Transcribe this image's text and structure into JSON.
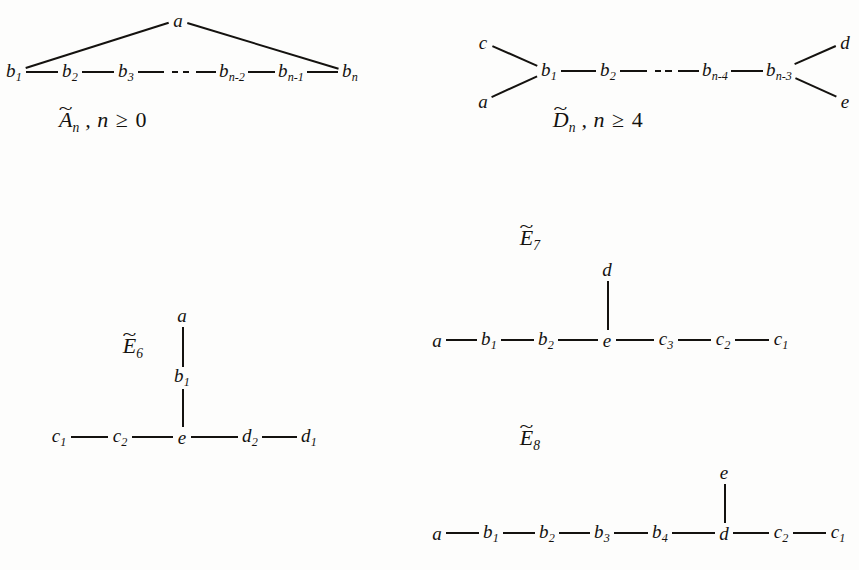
{
  "figure": {
    "ink_color": "#14120f",
    "background_color": "#fdfdfc"
  },
  "diagrams": [
    {
      "id": "A-tilde",
      "name": "A_n_affine",
      "label_base": "A",
      "label_sub": "n",
      "tilde": "~",
      "condition_var": "n",
      "condition_rel": "≥",
      "condition_value": "0",
      "label_text": "Ãₙ , n ≥ 0",
      "label_x": 103,
      "label_y": 122,
      "nodes": [
        {
          "name": "a",
          "base": "a",
          "sub": "",
          "x": 178,
          "y": 20
        },
        {
          "name": "b1",
          "base": "b",
          "sub": "1",
          "x": 14,
          "y": 72
        },
        {
          "name": "b2",
          "base": "b",
          "sub": "2",
          "x": 70,
          "y": 72
        },
        {
          "name": "b3",
          "base": "b",
          "sub": "3",
          "x": 126,
          "y": 72
        },
        {
          "name": "bn-2",
          "base": "b",
          "sub": "n-2",
          "x": 232,
          "y": 72
        },
        {
          "name": "bn-1",
          "base": "b",
          "sub": "n-1",
          "x": 291,
          "y": 72
        },
        {
          "name": "bn",
          "base": "b",
          "sub": "n",
          "x": 350,
          "y": 72
        }
      ],
      "edges": [
        {
          "from": "b1",
          "to": "a"
        },
        {
          "from": "a",
          "to": "bn"
        },
        {
          "from": "b1",
          "to": "b2"
        },
        {
          "from": "b2",
          "to": "b3"
        },
        {
          "from": "bn-2",
          "to": "bn-1"
        },
        {
          "from": "bn-1",
          "to": "bn"
        }
      ],
      "ellipsis_between": [
        "b3",
        "bn-2"
      ]
    },
    {
      "id": "D-tilde",
      "name": "D_n_affine",
      "label_base": "D",
      "label_sub": "n",
      "tilde": "~",
      "condition_var": "n",
      "condition_rel": "≥",
      "condition_value": "4",
      "label_text": "D̃ₙ , n ≥ 4",
      "label_x": 598,
      "label_y": 122,
      "nodes": [
        {
          "name": "c",
          "base": "c",
          "sub": "",
          "x": 483,
          "y": 42
        },
        {
          "name": "a",
          "base": "a",
          "sub": "",
          "x": 483,
          "y": 101
        },
        {
          "name": "b1",
          "base": "b",
          "sub": "1",
          "x": 549,
          "y": 71
        },
        {
          "name": "b2",
          "base": "b",
          "sub": "2",
          "x": 608,
          "y": 71
        },
        {
          "name": "bn-4",
          "base": "b",
          "sub": "n-4",
          "x": 715,
          "y": 71
        },
        {
          "name": "bn-3",
          "base": "b",
          "sub": "n-3",
          "x": 779,
          "y": 71
        },
        {
          "name": "d",
          "base": "d",
          "sub": "",
          "x": 845,
          "y": 42
        },
        {
          "name": "e",
          "base": "e",
          "sub": "",
          "x": 845,
          "y": 101
        }
      ],
      "edges": [
        {
          "from": "c",
          "to": "b1"
        },
        {
          "from": "a",
          "to": "b1"
        },
        {
          "from": "b1",
          "to": "b2"
        },
        {
          "from": "bn-4",
          "to": "bn-3"
        },
        {
          "from": "bn-3",
          "to": "d"
        },
        {
          "from": "bn-3",
          "to": "e"
        }
      ],
      "ellipsis_between": [
        "b2",
        "bn-4"
      ]
    },
    {
      "id": "E6-tilde",
      "name": "E_6_affine",
      "label_base": "E",
      "label_sub": "6",
      "tilde": "~",
      "condition_var": "",
      "condition_rel": "",
      "condition_value": "",
      "label_text": "Ẽ₆",
      "label_x": 133,
      "label_y": 348,
      "nodes": [
        {
          "name": "a",
          "base": "a",
          "sub": "",
          "x": 182,
          "y": 315
        },
        {
          "name": "b1",
          "base": "b",
          "sub": "1",
          "x": 182,
          "y": 377
        },
        {
          "name": "e",
          "base": "e",
          "sub": "",
          "x": 182,
          "y": 437
        },
        {
          "name": "c2",
          "base": "c",
          "sub": "2",
          "x": 120,
          "y": 437
        },
        {
          "name": "c1",
          "base": "c",
          "sub": "1",
          "x": 59,
          "y": 437
        },
        {
          "name": "d2",
          "base": "d",
          "sub": "2",
          "x": 250,
          "y": 437
        },
        {
          "name": "d1",
          "base": "d",
          "sub": "1",
          "x": 309,
          "y": 437
        }
      ],
      "edges": [
        {
          "from": "a",
          "to": "b1"
        },
        {
          "from": "b1",
          "to": "e"
        },
        {
          "from": "c1",
          "to": "c2"
        },
        {
          "from": "c2",
          "to": "e"
        },
        {
          "from": "e",
          "to": "d2"
        },
        {
          "from": "d2",
          "to": "d1"
        }
      ],
      "ellipsis_between": []
    },
    {
      "id": "E7-tilde",
      "name": "E_7_affine",
      "label_base": "E",
      "label_sub": "7",
      "tilde": "~",
      "condition_var": "",
      "condition_rel": "",
      "condition_value": "",
      "label_text": "Ẽ₇",
      "label_x": 530,
      "label_y": 240,
      "nodes": [
        {
          "name": "d",
          "base": "d",
          "sub": "",
          "x": 607,
          "y": 269
        },
        {
          "name": "e",
          "base": "e",
          "sub": "",
          "x": 607,
          "y": 340
        },
        {
          "name": "a",
          "base": "a",
          "sub": "",
          "x": 437,
          "y": 340
        },
        {
          "name": "b1",
          "base": "b",
          "sub": "1",
          "x": 489,
          "y": 340
        },
        {
          "name": "b2",
          "base": "b",
          "sub": "2",
          "x": 546,
          "y": 340
        },
        {
          "name": "c3",
          "base": "c",
          "sub": "3",
          "x": 666,
          "y": 340
        },
        {
          "name": "c2",
          "base": "c",
          "sub": "2",
          "x": 723,
          "y": 340
        },
        {
          "name": "c1",
          "base": "c",
          "sub": "1",
          "x": 781,
          "y": 340
        }
      ],
      "edges": [
        {
          "from": "d",
          "to": "e"
        },
        {
          "from": "a",
          "to": "b1"
        },
        {
          "from": "b1",
          "to": "b2"
        },
        {
          "from": "b2",
          "to": "e"
        },
        {
          "from": "e",
          "to": "c3"
        },
        {
          "from": "c3",
          "to": "c2"
        },
        {
          "from": "c2",
          "to": "c1"
        }
      ],
      "ellipsis_between": []
    },
    {
      "id": "E8-tilde",
      "name": "E_8_affine",
      "label_base": "E",
      "label_sub": "8",
      "tilde": "~",
      "condition_var": "",
      "condition_rel": "",
      "condition_value": "",
      "label_text": "Ẽ₈",
      "label_x": 530,
      "label_y": 440,
      "nodes": [
        {
          "name": "e",
          "base": "e",
          "sub": "",
          "x": 724,
          "y": 472
        },
        {
          "name": "d",
          "base": "d",
          "sub": "",
          "x": 724,
          "y": 533
        },
        {
          "name": "a",
          "base": "a",
          "sub": "",
          "x": 437,
          "y": 533
        },
        {
          "name": "b1",
          "base": "b",
          "sub": "1",
          "x": 491,
          "y": 533
        },
        {
          "name": "b2",
          "base": "b",
          "sub": "2",
          "x": 547,
          "y": 533
        },
        {
          "name": "b3",
          "base": "b",
          "sub": "3",
          "x": 602,
          "y": 533
        },
        {
          "name": "b4",
          "base": "b",
          "sub": "4",
          "x": 660,
          "y": 533
        },
        {
          "name": "c2",
          "base": "c",
          "sub": "2",
          "x": 781,
          "y": 533
        },
        {
          "name": "c1",
          "base": "c",
          "sub": "1",
          "x": 838,
          "y": 533
        }
      ],
      "edges": [
        {
          "from": "e",
          "to": "d"
        },
        {
          "from": "a",
          "to": "b1"
        },
        {
          "from": "b1",
          "to": "b2"
        },
        {
          "from": "b2",
          "to": "b3"
        },
        {
          "from": "b3",
          "to": "b4"
        },
        {
          "from": "b4",
          "to": "d"
        },
        {
          "from": "d",
          "to": "c2"
        },
        {
          "from": "c2",
          "to": "c1"
        }
      ],
      "ellipsis_between": []
    }
  ]
}
